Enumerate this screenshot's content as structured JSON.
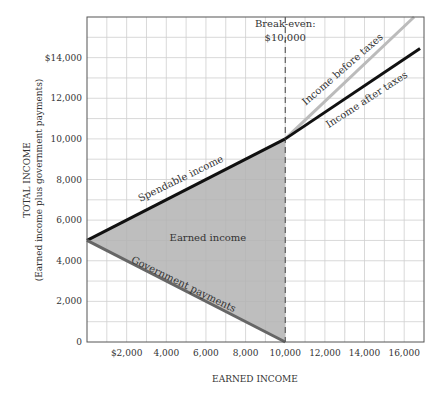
{
  "chart_data": {
    "type": "line",
    "title": "",
    "xlabel": "EARNED INCOME",
    "ylabel": "TOTAL INCOME",
    "ylabel_sub": "(Earned income plus government payments)",
    "xlim": [
      0,
      17000
    ],
    "ylim": [
      0,
      16000
    ],
    "grid": true,
    "grid_step": 1000,
    "x_ticks": [
      {
        "value": 2000,
        "label": "$2,000"
      },
      {
        "value": 4000,
        "label": "4,000"
      },
      {
        "value": 6000,
        "label": "6,000"
      },
      {
        "value": 8000,
        "label": "8,000"
      },
      {
        "value": 10000,
        "label": "10,000"
      },
      {
        "value": 12000,
        "label": "12,000"
      },
      {
        "value": 14000,
        "label": "14,000"
      },
      {
        "value": 16000,
        "label": "16,000"
      }
    ],
    "y_ticks": [
      {
        "value": 0,
        "label": "0"
      },
      {
        "value": 2000,
        "label": "2,000"
      },
      {
        "value": 4000,
        "label": "4,000"
      },
      {
        "value": 6000,
        "label": "6,000"
      },
      {
        "value": 8000,
        "label": "8,000"
      },
      {
        "value": 10000,
        "label": "10,000"
      },
      {
        "value": 12000,
        "label": "12,000"
      },
      {
        "value": 14000,
        "label": "$14,000"
      }
    ],
    "series": [
      {
        "name": "Spendable income",
        "color": "#111111",
        "width": 3,
        "points": [
          [
            0,
            5000
          ],
          [
            10000,
            10000
          ]
        ]
      },
      {
        "name": "Government payments",
        "color": "#666666",
        "width": 3,
        "points": [
          [
            0,
            5000
          ],
          [
            10000,
            0
          ]
        ]
      },
      {
        "name": "Income before taxes",
        "color": "#bbbbbb",
        "width": 3,
        "points": [
          [
            10000,
            10000
          ],
          [
            16500,
            16000
          ]
        ]
      },
      {
        "name": "Income after taxes",
        "color": "#111111",
        "width": 3,
        "points": [
          [
            10000,
            10000
          ],
          [
            16800,
            14450
          ]
        ]
      }
    ],
    "shaded_region": {
      "name": "Earned income",
      "color": "#b3b3b3",
      "points": [
        [
          0,
          5000
        ],
        [
          10000,
          10000
        ],
        [
          10000,
          0
        ]
      ]
    },
    "annotations": [
      {
        "text": "Break-even:",
        "x": 10000,
        "y": 15500
      },
      {
        "text": "$10,000",
        "x": 10000,
        "y": 14800
      },
      {
        "text": "Spendable income",
        "x": 4800,
        "y": 7900,
        "angle": -26
      },
      {
        "text": "Earned income",
        "x": 6100,
        "y": 4950,
        "angle": 0
      },
      {
        "text": "Government payments",
        "x": 4800,
        "y": 2700,
        "angle": 26
      },
      {
        "text": "Income before taxes",
        "x": 13000,
        "y": 13300,
        "angle": -41
      },
      {
        "text": "Income after taxes",
        "x": 14200,
        "y": 11800,
        "angle": -33
      }
    ],
    "break_even_line": {
      "x": 10000,
      "style": "dashed"
    }
  }
}
